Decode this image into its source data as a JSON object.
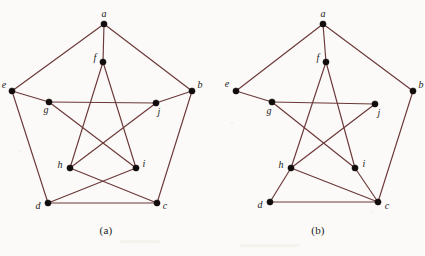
{
  "figure": {
    "background_color": "#fbfaf8",
    "edge_color": "#6b3838",
    "vertex_color": "#120c0c",
    "panels": [
      {
        "id": "a",
        "caption": "(a)",
        "vertices": [
          {
            "id": "a",
            "label": "a",
            "x": 104,
            "y": 24,
            "label_dx": 0,
            "label_dy": -7
          },
          {
            "id": "b",
            "label": "b",
            "x": 192,
            "y": 91,
            "label_dx": 8,
            "label_dy": -3
          },
          {
            "id": "c",
            "label": "c",
            "x": 157,
            "y": 203,
            "label_dx": 8,
            "label_dy": 6
          },
          {
            "id": "d",
            "label": "d",
            "x": 48,
            "y": 203,
            "label_dx": -10,
            "label_dy": 6
          },
          {
            "id": "e",
            "label": "e",
            "x": 12,
            "y": 91,
            "label_dx": -8,
            "label_dy": -3
          },
          {
            "id": "f",
            "label": "f",
            "x": 103,
            "y": 62,
            "label_dx": -8,
            "label_dy": -1
          },
          {
            "id": "g",
            "label": "g",
            "x": 49,
            "y": 102,
            "label_dx": -3,
            "label_dy": 11
          },
          {
            "id": "h",
            "label": "h",
            "x": 70,
            "y": 168,
            "label_dx": -10,
            "label_dy": 0
          },
          {
            "id": "i",
            "label": "i",
            "x": 136,
            "y": 168,
            "label_dx": 8,
            "label_dy": -1
          },
          {
            "id": "j",
            "label": "j",
            "x": 156,
            "y": 103,
            "label_dx": 3,
            "label_dy": 12
          }
        ],
        "edges": [
          [
            "a",
            "b"
          ],
          [
            "a",
            "e"
          ],
          [
            "a",
            "f"
          ],
          [
            "b",
            "c"
          ],
          [
            "b",
            "j"
          ],
          [
            "c",
            "d"
          ],
          [
            "c",
            "h"
          ],
          [
            "d",
            "e"
          ],
          [
            "d",
            "i"
          ],
          [
            "e",
            "g"
          ],
          [
            "f",
            "h"
          ],
          [
            "f",
            "i"
          ],
          [
            "g",
            "i"
          ],
          [
            "g",
            "j"
          ],
          [
            "h",
            "j"
          ]
        ],
        "edge_count": 15,
        "vertex_count": 10
      },
      {
        "id": "b",
        "caption": "(b)",
        "vertices": [
          {
            "id": "a",
            "label": "a",
            "x": 111,
            "y": 24,
            "label_dx": 0,
            "label_dy": -7
          },
          {
            "id": "b",
            "label": "b",
            "x": 201,
            "y": 91,
            "label_dx": 8,
            "label_dy": -3
          },
          {
            "id": "c",
            "label": "c",
            "x": 166,
            "y": 202,
            "label_dx": 9,
            "label_dy": 7
          },
          {
            "id": "d",
            "label": "d",
            "x": 58,
            "y": 202,
            "label_dx": -10,
            "label_dy": 6
          },
          {
            "id": "e",
            "label": "e",
            "x": 24,
            "y": 91,
            "label_dx": -9,
            "label_dy": -4
          },
          {
            "id": "f",
            "label": "f",
            "x": 114,
            "y": 62,
            "label_dx": -8,
            "label_dy": -1
          },
          {
            "id": "g",
            "label": "g",
            "x": 60,
            "y": 102,
            "label_dx": -3,
            "label_dy": 12
          },
          {
            "id": "h",
            "label": "h",
            "x": 79,
            "y": 168,
            "label_dx": -10,
            "label_dy": 0
          },
          {
            "id": "i",
            "label": "i",
            "x": 143,
            "y": 168,
            "label_dx": 9,
            "label_dy": -1
          },
          {
            "id": "j",
            "label": "j",
            "x": 163,
            "y": 104,
            "label_dx": 4,
            "label_dy": 12
          }
        ],
        "edges": [
          [
            "a",
            "b"
          ],
          [
            "a",
            "e"
          ],
          [
            "a",
            "f"
          ],
          [
            "b",
            "c"
          ],
          [
            "c",
            "d"
          ],
          [
            "c",
            "h"
          ],
          [
            "c",
            "i"
          ],
          [
            "d",
            "h"
          ],
          [
            "e",
            "g"
          ],
          [
            "f",
            "h"
          ],
          [
            "f",
            "i"
          ],
          [
            "g",
            "i"
          ],
          [
            "g",
            "j"
          ],
          [
            "h",
            "j"
          ]
        ],
        "edge_count": 14,
        "vertex_count": 10
      }
    ]
  }
}
